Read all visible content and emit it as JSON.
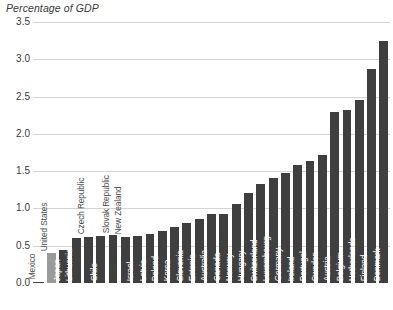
{
  "chart_data": {
    "type": "bar",
    "title": "Percentage of GDP",
    "xlabel": "",
    "ylabel": "",
    "ylim": [
      0,
      3.5
    ],
    "yticks": [
      "0.0",
      "0.5",
      "1.0",
      "1.5",
      "2.0",
      "2.5",
      "3.0",
      "3.5"
    ],
    "ytick_values": [
      0.0,
      0.5,
      1.0,
      1.5,
      2.0,
      2.5,
      3.0,
      3.5
    ],
    "grid": true,
    "legend": "none",
    "categories": [
      "Mexico",
      "United States",
      "Japan",
      "Lithuania",
      "Czech Republic",
      "Chile",
      "Slovak Republic",
      "New Zealand",
      "Israel",
      "Latvia",
      "Poland",
      "Korea",
      "Slovenia",
      "Estonia",
      "Australia",
      "Canada",
      "Norway",
      "Hungary",
      "Switzerland",
      "Luxembourg",
      "Germany",
      "Ireland",
      "Portugal",
      "Sweden",
      "Austria",
      "Belgium",
      "Netherlands",
      "Finland",
      "Denmark"
    ],
    "values": [
      0.02,
      0.4,
      0.44,
      0.6,
      0.62,
      0.63,
      0.64,
      0.62,
      0.63,
      0.66,
      0.7,
      0.75,
      0.8,
      0.86,
      0.93,
      0.92,
      1.06,
      1.21,
      1.33,
      1.41,
      1.47,
      1.58,
      1.63,
      1.72,
      2.3,
      2.32,
      2.45,
      2.87,
      3.25
    ],
    "bar_colors": [
      "#3f3f3f",
      "#9a9a9a",
      "#3f3f3f",
      "#3f3f3f",
      "#3f3f3f",
      "#3f3f3f",
      "#3f3f3f",
      "#3f3f3f",
      "#3f3f3f",
      "#3f3f3f",
      "#3f3f3f",
      "#3f3f3f",
      "#3f3f3f",
      "#3f3f3f",
      "#3f3f3f",
      "#3f3f3f",
      "#3f3f3f",
      "#3f3f3f",
      "#3f3f3f",
      "#3f3f3f",
      "#3f3f3f",
      "#3f3f3f",
      "#3f3f3f",
      "#3f3f3f",
      "#3f3f3f",
      "#3f3f3f",
      "#3f3f3f",
      "#3f3f3f",
      "#3f3f3f"
    ],
    "accent_color": "#3f3f3f",
    "highlight_color": "#9a9a9a",
    "grid_color": "#d4d4d4",
    "text_color": "#3b3b3b"
  }
}
